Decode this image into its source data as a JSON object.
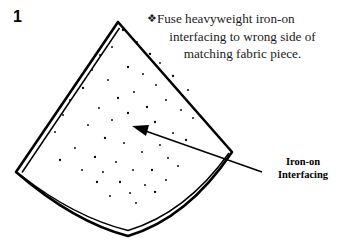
{
  "step": {
    "number": "1"
  },
  "instruction": {
    "bullet": "❖",
    "line1": "Fuse heavyweight iron-on",
    "line2": "interfacing to wrong side of",
    "line3": "matching fabric piece."
  },
  "callout": {
    "line1": "Iron-on",
    "line2": "Interfacing"
  },
  "colors": {
    "ink": "#000000",
    "text": "#1a1a1a",
    "background": "#ffffff"
  },
  "diagram": {
    "type": "line-drawing",
    "apex": [
      118,
      22
    ],
    "left_vertex": [
      16,
      172
    ],
    "right_vertex": [
      232,
      152
    ],
    "bottom_arc_lowest": [
      128,
      237
    ],
    "outline_path": "M118,22 L16,172 Q128,252 232,152 Z",
    "inner_offset_path": "M119,27 L22,172 Q128,246 229,152",
    "arrow": {
      "from": [
        262,
        172
      ],
      "to": [
        132,
        126
      ]
    },
    "dots": [
      [
        123,
        30
      ],
      [
        137,
        42
      ],
      [
        112,
        47
      ],
      [
        150,
        54
      ],
      [
        100,
        55
      ],
      [
        160,
        63
      ],
      [
        128,
        67
      ],
      [
        92,
        70
      ],
      [
        143,
        74
      ],
      [
        173,
        76
      ],
      [
        108,
        80
      ],
      [
        156,
        85
      ],
      [
        83,
        88
      ],
      [
        134,
        92
      ],
      [
        188,
        90
      ],
      [
        118,
        98
      ],
      [
        166,
        100
      ],
      [
        70,
        100
      ],
      [
        147,
        107
      ],
      [
        99,
        108
      ],
      [
        181,
        110
      ],
      [
        128,
        113
      ],
      [
        63,
        115
      ],
      [
        112,
        120
      ],
      [
        155,
        122
      ],
      [
        193,
        118
      ],
      [
        88,
        125
      ],
      [
        140,
        130
      ],
      [
        173,
        133
      ],
      [
        55,
        132
      ],
      [
        105,
        138
      ],
      [
        124,
        143
      ],
      [
        160,
        145
      ],
      [
        186,
        140
      ],
      [
        75,
        148
      ],
      [
        142,
        152
      ],
      [
        95,
        157
      ],
      [
        116,
        162
      ],
      [
        168,
        158
      ],
      [
        60,
        160
      ],
      [
        133,
        170
      ],
      [
        103,
        172
      ],
      [
        152,
        170
      ],
      [
        178,
        166
      ],
      [
        82,
        170
      ],
      [
        120,
        182
      ],
      [
        145,
        185
      ],
      [
        166,
        180
      ],
      [
        97,
        182
      ],
      [
        130,
        193
      ],
      [
        110,
        196
      ],
      [
        155,
        192
      ],
      [
        136,
        203
      ]
    ]
  }
}
